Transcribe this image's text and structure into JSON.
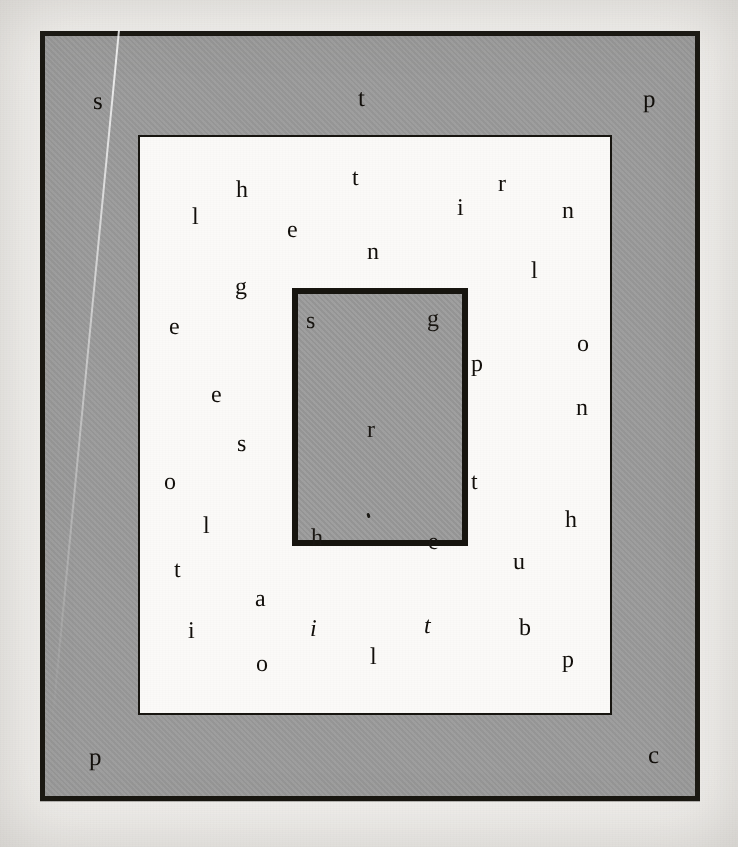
{
  "figure": {
    "colors": {
      "outer_fill": "#9b9b9b",
      "outer_border": "#17150f",
      "middle_fill": "#fbfaf8",
      "middle_border": "#171510",
      "inner_fill": "#9b9b9b",
      "inner_border": "#17150f",
      "page_background": "#f2f0ed",
      "letter_ink": "#120f0b"
    },
    "rectangles": [
      {
        "name": "outer-rectangle",
        "fill": "gray",
        "x": 40,
        "y": 31,
        "width": 660,
        "height": 770,
        "border_width": 5
      },
      {
        "name": "middle-rectangle",
        "fill": "white",
        "x": 138,
        "y": 135,
        "width": 474,
        "height": 580,
        "border_width": 2
      },
      {
        "name": "inner-rectangle",
        "fill": "gray",
        "x": 292,
        "y": 288,
        "width": 176,
        "height": 258,
        "border_width": 6
      }
    ]
  },
  "letters": {
    "outer_gray_band": [
      {
        "char": "s",
        "x": 93,
        "y": 89,
        "style": "roman"
      },
      {
        "char": "t",
        "x": 358,
        "y": 86,
        "style": "roman"
      },
      {
        "char": "p",
        "x": 643,
        "y": 87,
        "style": "roman"
      },
      {
        "char": "p",
        "x": 89,
        "y": 745,
        "style": "roman"
      },
      {
        "char": "c",
        "x": 648,
        "y": 743,
        "style": "roman"
      }
    ],
    "middle_white_area": [
      {
        "char": "h",
        "x": 236,
        "y": 178,
        "style": "roman"
      },
      {
        "char": "t",
        "x": 352,
        "y": 166,
        "style": "roman"
      },
      {
        "char": "r",
        "x": 498,
        "y": 172,
        "style": "roman"
      },
      {
        "char": "l",
        "x": 192,
        "y": 205,
        "style": "roman"
      },
      {
        "char": "i",
        "x": 457,
        "y": 196,
        "style": "roman"
      },
      {
        "char": "n",
        "x": 562,
        "y": 199,
        "style": "roman"
      },
      {
        "char": "e",
        "x": 287,
        "y": 218,
        "style": "roman"
      },
      {
        "char": "n",
        "x": 367,
        "y": 240,
        "style": "roman"
      },
      {
        "char": "l",
        "x": 531,
        "y": 259,
        "style": "roman"
      },
      {
        "char": "g",
        "x": 235,
        "y": 275,
        "style": "roman"
      },
      {
        "char": "e",
        "x": 169,
        "y": 315,
        "style": "roman"
      },
      {
        "char": "o",
        "x": 577,
        "y": 332,
        "style": "roman"
      },
      {
        "char": "p",
        "x": 471,
        "y": 352,
        "style": "roman"
      },
      {
        "char": "e",
        "x": 211,
        "y": 383,
        "style": "roman"
      },
      {
        "char": "n",
        "x": 576,
        "y": 396,
        "style": "roman"
      },
      {
        "char": "s",
        "x": 237,
        "y": 432,
        "style": "roman"
      },
      {
        "char": "o",
        "x": 164,
        "y": 470,
        "style": "roman"
      },
      {
        "char": "t",
        "x": 471,
        "y": 470,
        "style": "roman"
      },
      {
        "char": "l",
        "x": 203,
        "y": 514,
        "style": "roman"
      },
      {
        "char": "h",
        "x": 565,
        "y": 508,
        "style": "roman"
      },
      {
        "char": "u",
        "x": 513,
        "y": 550,
        "style": "roman"
      },
      {
        "char": "t",
        "x": 174,
        "y": 558,
        "style": "roman"
      },
      {
        "char": "a",
        "x": 255,
        "y": 587,
        "style": "roman"
      },
      {
        "char": "i",
        "x": 188,
        "y": 619,
        "style": "roman"
      },
      {
        "char": "i",
        "x": 310,
        "y": 617,
        "style": "italic"
      },
      {
        "char": "t",
        "x": 424,
        "y": 614,
        "style": "italic"
      },
      {
        "char": "b",
        "x": 519,
        "y": 616,
        "style": "roman"
      },
      {
        "char": "o",
        "x": 256,
        "y": 652,
        "style": "roman"
      },
      {
        "char": "l",
        "x": 370,
        "y": 645,
        "style": "roman"
      },
      {
        "char": "p",
        "x": 562,
        "y": 648,
        "style": "roman"
      }
    ],
    "inner_gray_area": [
      {
        "char": "s",
        "x": 306,
        "y": 309,
        "style": "roman"
      },
      {
        "char": "g",
        "x": 427,
        "y": 307,
        "style": "roman"
      },
      {
        "char": "r",
        "x": 367,
        "y": 418,
        "style": "roman"
      },
      {
        "char": "h",
        "x": 311,
        "y": 526,
        "style": "roman"
      },
      {
        "char": "e",
        "x": 428,
        "y": 530,
        "style": "roman"
      }
    ]
  },
  "artifacts": {
    "ink_speck": {
      "name": "ink-speck",
      "x": 367,
      "y": 513
    },
    "crease": {
      "name": "scan-crease"
    },
    "ghost_text": [
      {
        "text": "ered into the line-by and variable",
        "x": 150,
        "y": 140,
        "size": 25
      },
      {
        "text": "shaky ravine, go hand",
        "x": 170,
        "y": 295,
        "size": 25
      },
      {
        "text": "arting and then can",
        "x": 158,
        "y": 370,
        "size": 25
      },
      {
        "text": "om the crosses, problem",
        "x": 150,
        "y": 450,
        "size": 25
      },
      {
        "text": "ntribution on the same things",
        "x": 150,
        "y": 530,
        "size": 25
      },
      {
        "text": "ong the right-hand side of",
        "x": 150,
        "y": 600,
        "size": 25
      }
    ]
  }
}
